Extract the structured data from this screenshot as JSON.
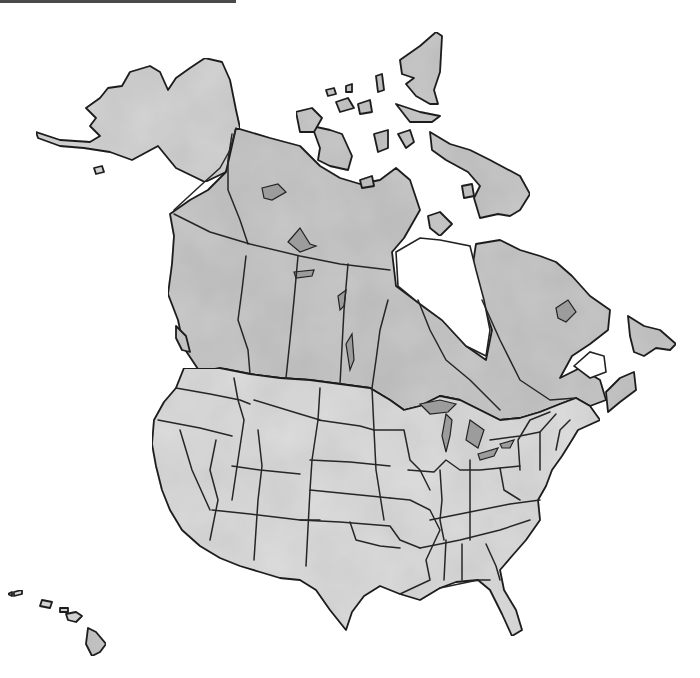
{
  "map": {
    "type": "blank outline map",
    "region": "North America",
    "style": "watercolor grayscale",
    "colors": {
      "background": "#ffffff",
      "canada_fill": "#c9c9c9",
      "usa_fill": "#dedede",
      "alaska_fill": "#d6d6d6",
      "outline": "#222222",
      "lake_fill": "#9c9c9c",
      "top_rule": "#4a4a4a"
    },
    "regions": [
      {
        "name": "Alaska"
      },
      {
        "name": "Canada"
      },
      {
        "name": "Arctic Archipelago"
      },
      {
        "name": "Contiguous United States"
      },
      {
        "name": "Hawaii"
      },
      {
        "name": "Newfoundland"
      }
    ],
    "labels": []
  }
}
